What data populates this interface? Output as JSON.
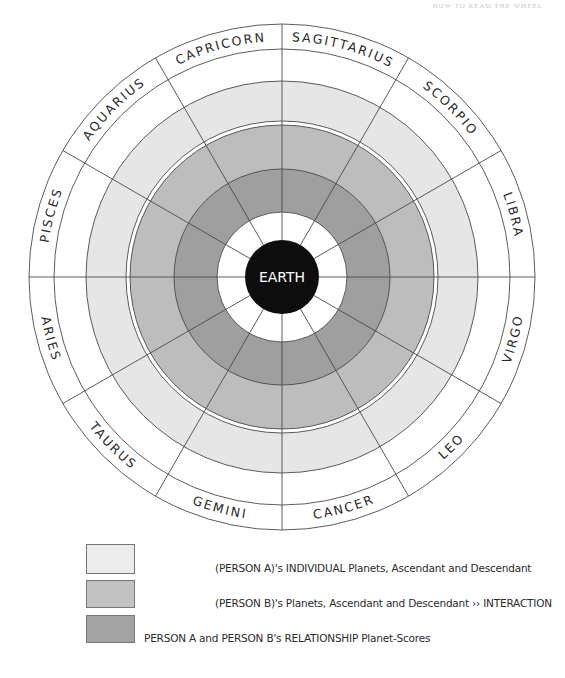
{
  "header": {
    "running_head": "HOW TO READ THE WHEEL"
  },
  "wheel": {
    "center_label": "EARTH",
    "signs": [
      {
        "name": "SAGITTARIUS",
        "angle": -75
      },
      {
        "name": "SCORPIO",
        "angle": -45
      },
      {
        "name": "LIBRA",
        "angle": -15
      },
      {
        "name": "VIRGO",
        "angle": 15
      },
      {
        "name": "LEO",
        "angle": 45
      },
      {
        "name": "CANCER",
        "angle": 75
      },
      {
        "name": "GEMINI",
        "angle": 105
      },
      {
        "name": "TAURUS",
        "angle": 135
      },
      {
        "name": "ARIES",
        "angle": 165
      },
      {
        "name": "PISCES",
        "angle": 195
      },
      {
        "name": "AQUARIUS",
        "angle": 225
      },
      {
        "name": "CAPRICORN",
        "angle": 255
      }
    ],
    "rings": [
      {
        "name": "zodiac-band",
        "r_outer": 253,
        "r_inner": 228,
        "fill": "#ffffff"
      },
      {
        "name": "blank-band",
        "r_outer": 228,
        "r_inner": 196,
        "fill": "#ffffff"
      },
      {
        "name": "person-a-ring",
        "r_outer": 196,
        "r_inner": 156,
        "fill": "#e6e6e6"
      },
      {
        "name": "person-b-ring",
        "r_outer": 152,
        "r_inner": 108,
        "fill": "#bdbdbd"
      },
      {
        "name": "relationship-ring",
        "r_outer": 108,
        "r_inner": 65,
        "fill": "#9f9f9f"
      },
      {
        "name": "inner-white-ring",
        "r_outer": 65,
        "r_inner": 37,
        "fill": "#ffffff"
      }
    ],
    "colors": {
      "earth": "#0d0d0d",
      "lines": "#4a4a4a",
      "label": "#2a2a2a"
    }
  },
  "legend": {
    "items": [
      {
        "color": "#ececec",
        "label": "(PERSON A)'s INDIVIDUAL Planets, Ascendant and Descendant"
      },
      {
        "color": "#c2c2c2",
        "label": "(PERSON B)'s Planets, Ascendant and Descendant ›› INTERACTION"
      },
      {
        "color": "#a3a3a3",
        "label": "PERSON A and PERSON B's RELATIONSHIP Planet-Scores"
      }
    ]
  }
}
